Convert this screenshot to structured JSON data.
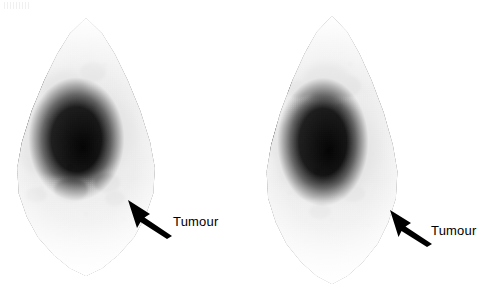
{
  "figure": {
    "kind": "medical-scintigram-pair",
    "background_color": "#ffffff",
    "ink_color": "#000000",
    "panels": [
      {
        "id": "left-scan",
        "name": "left-scintigram",
        "annotation": {
          "label": "Tumour",
          "arrow": "arrow-up-left",
          "arrow_points_to": "lower-right-margin-defect"
        }
      },
      {
        "id": "right-scan",
        "name": "right-scintigram",
        "annotation": {
          "label": "Tumour",
          "arrow": "arrow-up-left",
          "arrow_points_to": "lower-right-margin-defect"
        }
      }
    ]
  }
}
